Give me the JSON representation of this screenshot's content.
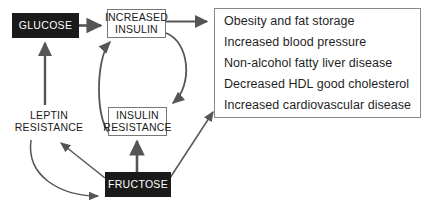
{
  "diagram": {
    "colors": {
      "dark_node_bg": "#1a1a1a",
      "dark_node_text": "#ffffff",
      "light_node_border": "#777777",
      "edge": "#555555",
      "outcome_box_border": "#888888",
      "background": "#ffffff"
    },
    "nodes": {
      "glucose": {
        "label": "GLUCOSE",
        "style": "dark-filled"
      },
      "increased_insulin": {
        "line1": "INCREASED",
        "line2": "INSULIN",
        "style": "outlined"
      },
      "insulin_resistance": {
        "line1": "INSULIN",
        "line2": "RESISTANCE",
        "style": "outlined"
      },
      "leptin_resistance": {
        "line1": "LEPTIN",
        "line2": "RESISTANCE",
        "style": "plain-text"
      },
      "fructose": {
        "label": "FRUCTOSE",
        "style": "dark-filled"
      }
    },
    "outcomes": {
      "items": [
        "Obesity and fat storage",
        "Increased blood pressure",
        "Non-alcohol fatty liver disease",
        "Decreased HDL good cholesterol",
        "Increased cardiovascular disease"
      ]
    },
    "edges": [
      {
        "name": "glucose-to-increased-insulin",
        "from": "glucose",
        "to": "increased_insulin",
        "shape": "straight-horizontal"
      },
      {
        "name": "increased-insulin-to-outcomes",
        "from": "increased_insulin",
        "to": "outcomes",
        "shape": "straight-horizontal"
      },
      {
        "name": "increased-insulin-to-insulin-resistance",
        "from": "increased_insulin",
        "to": "insulin_resistance",
        "shape": "curved-right"
      },
      {
        "name": "insulin-resistance-to-increased-insulin",
        "from": "insulin_resistance",
        "to": "increased_insulin",
        "shape": "curved-left"
      },
      {
        "name": "leptin-resistance-to-glucose",
        "from": "leptin_resistance",
        "to": "glucose",
        "shape": "straight-vertical"
      },
      {
        "name": "fructose-to-insulin-resistance",
        "from": "fructose",
        "to": "insulin_resistance",
        "shape": "straight-vertical"
      },
      {
        "name": "fructose-to-leptin-resistance",
        "from": "fructose",
        "to": "leptin_resistance",
        "shape": "straight-diagonal"
      },
      {
        "name": "fructose-to-outcomes",
        "from": "fructose",
        "to": "outcomes",
        "shape": "straight-diagonal"
      },
      {
        "name": "leptin-resistance-to-fructose",
        "from": "leptin_resistance",
        "to": "fructose",
        "shape": "curved-loop"
      }
    ]
  }
}
